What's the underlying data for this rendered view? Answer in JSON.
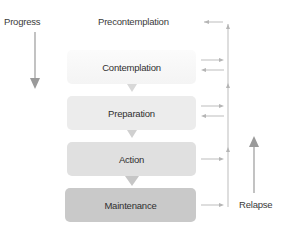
{
  "diagram": {
    "left_label": "Progress",
    "right_label": "Relapse",
    "stages": [
      {
        "label": "Precontemplation",
        "color": "#ffffff"
      },
      {
        "label": "Contemplation",
        "color": "#f6f6f6"
      },
      {
        "label": "Preparation",
        "color": "#ececec"
      },
      {
        "label": "Action",
        "color": "#e0e0e0"
      },
      {
        "label": "Maintenance",
        "color": "#c9c9c9"
      }
    ],
    "arrow_color": "#aaaaaa"
  }
}
